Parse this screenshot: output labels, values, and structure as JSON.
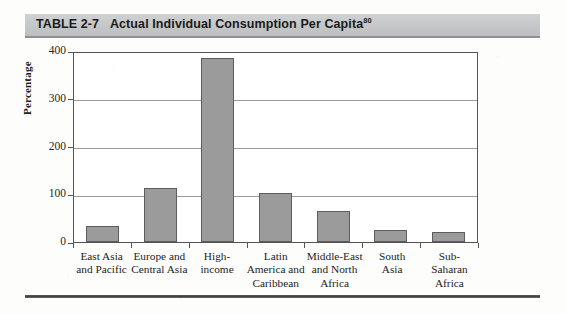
{
  "header": {
    "table_number": "TABLE 2-7",
    "title": "Actual Individual Consumption Per Capita",
    "footnote_marker": "80",
    "band_color": "#c4c6c8"
  },
  "chart_data": {
    "type": "bar",
    "title": "Actual Individual Consumption Per Capita",
    "xlabel": "",
    "ylabel": "Percentage",
    "ylim": [
      0,
      400
    ],
    "yticks": [
      0,
      100,
      200,
      300,
      400
    ],
    "grid": true,
    "legend": "none",
    "bar_color": "#9b9b9b",
    "bar_edge_color": "#5d5d5d",
    "categories": [
      "East Asia and Pacific",
      "Europe and Central Asia",
      "High-income",
      "Latin America and Caribbean",
      "Middle-East and North Africa",
      "South Asia",
      "Sub-Saharan Africa"
    ],
    "category_lines": [
      [
        "East Asia",
        "and Pacific"
      ],
      [
        "Europe and",
        "Central Asia"
      ],
      [
        "High-",
        "income"
      ],
      [
        "Latin",
        "America and",
        "Caribbean"
      ],
      [
        "Middle-East",
        "and North",
        "Africa"
      ],
      [
        "South",
        "Asia"
      ],
      [
        "Sub-",
        "Saharan",
        "Africa"
      ]
    ],
    "values": [
      33,
      114,
      385,
      103,
      64,
      25,
      21
    ]
  }
}
